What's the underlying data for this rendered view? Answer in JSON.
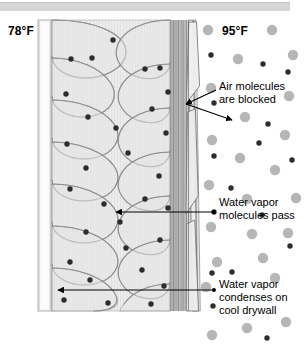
{
  "diagram": {
    "top_bar": {
      "name": "top-gray-bar",
      "color": "#d5d5d5"
    },
    "colors": {
      "insulation_fill": "#e9e9e9",
      "insulation_stroke": "#8c8c8c",
      "drywall_fill": "#f4f4f4",
      "drywall_stroke": "#9a9a9a",
      "sheathing_fill": "#d2d2d2",
      "sheathing_stroke": "#6f6f6f",
      "air_molecule": "#b3b3b3",
      "water_vapor": "#2b2b2b",
      "arrow": "#000000",
      "text": "#000000"
    },
    "labels": {
      "interior_temperature": "78°F",
      "exterior_temperature": "95°F",
      "air_blocked": "Air molecules\nare blocked",
      "vapor_pass": "Water vapor\nmolecules pass",
      "vapor_condenses": "Water vapor\ncondenses on\ncool drywall"
    },
    "legend_semantics": {
      "large_gray_circle": "air molecule",
      "small_dark_dot": "water vapor molecule"
    },
    "layers": [
      {
        "name": "drywall",
        "label": "drywall"
      },
      {
        "name": "fiberglass-insulation",
        "label": "fiberglass insulation batt"
      },
      {
        "name": "sheathing-stack",
        "label": "sheathing and housewrap layers"
      },
      {
        "name": "exterior-air",
        "label": "exterior air"
      }
    ],
    "arrows": [
      {
        "name": "arrow-air-blocked-upper",
        "points_to": "sheathing-stack"
      },
      {
        "name": "arrow-air-blocked-lower",
        "points_to": "exterior-air"
      },
      {
        "name": "arrow-vapor-pass",
        "points_to": "insulation"
      },
      {
        "name": "arrow-vapor-condenses",
        "points_to": "drywall"
      }
    ]
  }
}
